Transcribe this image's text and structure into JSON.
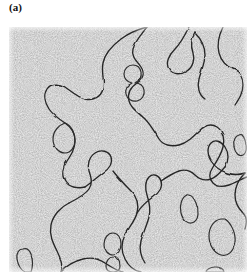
{
  "figure": {
    "panel_label": "(a)",
    "caption_text": "",
    "panel_kind": "contour-snapshot",
    "background_texture": "grainy-noise",
    "colors": {
      "page_background": "#ffffff",
      "panel_background": "#e8e8e8",
      "noise_dark": "#585858",
      "noise_light": "#f2f2f2",
      "contour_line": "#262626",
      "label_text": "#111111"
    },
    "panel_geometry": {
      "left": 9,
      "top": 27,
      "width": 238,
      "height": 245
    }
  },
  "chart_data": {
    "type": "contour-map",
    "title": "(a)",
    "xlabel": "",
    "ylabel": "",
    "xlim": [
      0,
      238
    ],
    "ylim": [
      0,
      245
    ],
    "grid": false,
    "legend": "none",
    "annotations": [],
    "contours": [
      {
        "name": "large-upper-left-domain",
        "closed": false,
        "path": "M 138 0 C 132 8 126 14 124 22 C 122 30 128 34 132 40 C 136 46 134 52 128 56 C 122 60 118 66 120 74 C 122 82 130 86 136 92 C 142 98 146 106 150 112 C 154 118 162 120 170 118 C 178 116 184 110 190 104 C 196 98 202 96 208 100 C 214 104 216 112 214 120 C 212 128 208 134 204 140 C 200 146 200 152 204 156 C 208 160 214 160 220 158 C 226 156 232 152 238 150"
      },
      {
        "name": "upper-left-lobe",
        "closed": false,
        "path": "M 138 0 C 130 2 120 6 112 12 C 104 18 96 26 94 36 C 92 46 96 54 94 62 C 92 70 84 74 76 72 C 68 70 62 64 56 60 C 50 56 42 56 38 62 C 34 68 36 76 40 82 C 44 88 50 92 56 96 C 62 100 66 106 66 114 C 66 122 62 128 58 134 C 54 140 52 148 56 154 C 60 160 68 162 76 160"
      },
      {
        "name": "small-left-appendage",
        "closed": true,
        "path": "M 56 96 C 50 98 44 104 44 112 C 44 120 50 126 56 126 C 62 126 66 120 66 113 C 66 106 62 98 56 96 Z"
      },
      {
        "name": "mid-left-spur",
        "closed": false,
        "path": "M 76 160 C 82 156 88 150 94 146 C 100 142 104 136 102 130 C 100 124 92 122 86 126 C 80 130 78 138 80 144 C 82 150 84 156 80 162 C 76 168 68 172 60 176"
      },
      {
        "name": "large-lower-left-domain",
        "closed": false,
        "path": "M 60 176 C 52 180 44 188 42 198 C 40 208 44 216 48 224 C 52 232 54 240 52 245"
      },
      {
        "name": "lower-left-domain-right-edge",
        "closed": false,
        "path": "M 104 144 C 110 152 116 158 122 164 C 128 170 130 178 128 186 C 126 194 120 200 116 208 C 112 216 112 224 116 232 C 120 240 126 244 132 245"
      },
      {
        "name": "lower-left-domain-bottom",
        "closed": false,
        "path": "M 52 245 C 58 238 66 234 74 232 C 82 230 90 232 96 236 C 102 240 108 244 114 245"
      },
      {
        "name": "center-vertical-finger",
        "closed": false,
        "path": "M 128 186 C 132 180 138 174 144 170 C 150 166 154 160 152 154 C 150 148 144 146 140 150 C 136 154 136 162 138 168 C 140 174 142 182 140 190 C 138 198 134 206 132 214 C 130 222 132 230 136 236"
      },
      {
        "name": "center-right-domain",
        "closed": false,
        "path": "M 152 154 C 158 150 164 146 170 144 C 176 142 182 144 186 148 C 190 152 196 154 202 152 C 208 150 212 144 216 140"
      },
      {
        "name": "right-arm-upper",
        "closed": false,
        "path": "M 216 140 C 220 134 220 126 216 120 C 212 114 206 112 202 116 C 198 120 198 128 202 134 C 206 140 212 144 218 146 C 224 148 230 148 236 146"
      },
      {
        "name": "right-edge-contour",
        "closed": false,
        "path": "M 236 146 C 230 152 226 160 226 168 C 226 176 230 182 234 186 C 238 190 238 196 236 202"
      },
      {
        "name": "upper-right-squiggle",
        "closed": false,
        "path": "M 180 0 C 176 8 172 16 166 22 C 160 28 156 36 160 42 C 164 48 172 48 178 44 C 184 40 186 32 184 26 C 182 20 182 12 186 6"
      },
      {
        "name": "upper-right-hook",
        "closed": false,
        "path": "M 186 6 C 192 12 196 20 196 28 C 196 36 192 44 190 52 C 188 60 190 68 196 72"
      },
      {
        "name": "far-right-top-contour",
        "closed": false,
        "path": "M 214 0 C 210 8 208 18 210 26 C 212 34 218 40 224 42 C 230 44 234 50 234 58 C 234 66 230 72 226 78"
      },
      {
        "name": "blob-figure-eight-upper",
        "closed": true,
        "path": "M 124 38 C 119 38 115 42 115 47 C 115 52 119 55 123 56 C 119 58 116 62 117 67 C 118 72 123 75 128 74 C 133 73 136 68 135 63 C 134 58 130 56 126 56 C 130 54 133 50 132 45 C 131 40 128 38 124 38 Z"
      },
      {
        "name": "blob-lower-center-upper",
        "closed": true,
        "path": "M 104 206 C 99 206 95 211 95 217 C 95 223 99 228 104 228 C 109 228 112 223 112 217 C 112 211 109 206 104 206 Z"
      },
      {
        "name": "blob-lower-center-lower",
        "closed": true,
        "path": "M 104 230 C 100 230 97 234 97 239 C 97 244 100 245 104 245 C 108 245 111 244 111 239 C 111 234 108 230 104 230 Z"
      },
      {
        "name": "blob-left-bottom",
        "closed": true,
        "path": "M 14 222 C 10 222 7 226 8 232 C 9 238 12 243 16 245 L 22 245 C 24 240 24 232 22 227 C 20 222 17 221 14 222 Z"
      },
      {
        "name": "blob-lower-right-large",
        "closed": true,
        "path": "M 212 192 C 205 193 200 200 200 209 C 200 218 205 226 212 228 C 219 230 225 224 226 215 C 227 206 222 196 216 192 Z"
      },
      {
        "name": "blob-lower-right-small",
        "closed": true,
        "path": "M 206 240 C 201 240 197 243 197 245 L 215 245 C 215 242 211 240 206 240 Z"
      },
      {
        "name": "blob-right-mid-sliver",
        "closed": true,
        "path": "M 178 168 C 173 170 170 178 172 186 C 174 194 180 198 185 195 C 190 192 190 183 187 176 C 184 169 181 167 178 168 Z"
      },
      {
        "name": "blob-mid-right-small",
        "closed": true,
        "path": "M 230 108 C 226 109 224 114 225 120 C 226 126 230 130 234 128 C 238 126 238 119 236 113 C 234 107 232 107 230 108 Z"
      }
    ]
  }
}
